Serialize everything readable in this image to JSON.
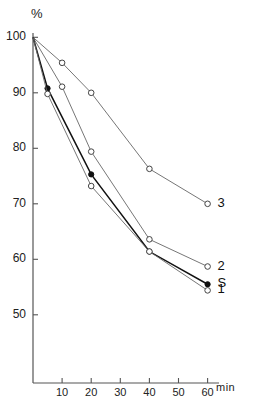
{
  "chart_data": {
    "type": "line",
    "title": "",
    "subtitle": "",
    "xlabel": "min",
    "ylabel": "%",
    "xlim": [
      0,
      62
    ],
    "ylim": [
      46,
      101
    ],
    "grid": false,
    "legend_position": "right-of-curve-ends",
    "x_ticks": [
      10,
      20,
      30,
      40,
      50,
      60
    ],
    "y_ticks": [
      50,
      60,
      70,
      80,
      90,
      100
    ],
    "x_tick_labels": [
      "10",
      "20",
      "30",
      "40",
      "50",
      "60"
    ],
    "y_tick_labels": [
      "50",
      "60",
      "70",
      "80",
      "90",
      "100"
    ],
    "annotations": [
      {
        "text": "3",
        "x": 60,
        "y": 70.0
      },
      {
        "text": "2",
        "x": 60,
        "y": 58.7
      },
      {
        "text": "S",
        "x": 60,
        "y": 55.5
      },
      {
        "text": "1",
        "x": 60,
        "y": 54.4
      }
    ],
    "series": [
      {
        "name": "3",
        "marker": "open-circle",
        "x": [
          0,
          10,
          20,
          40,
          60
        ],
        "values": [
          100,
          95.4,
          90.0,
          76.3,
          70.0
        ]
      },
      {
        "name": "2",
        "marker": "open-circle",
        "x": [
          0,
          10,
          20,
          40,
          60
        ],
        "values": [
          100,
          91.1,
          79.4,
          63.6,
          58.7
        ]
      },
      {
        "name": "S",
        "marker": "filled-circle",
        "x": [
          0,
          5,
          20,
          40,
          60
        ],
        "values": [
          100,
          90.8,
          75.3,
          61.4,
          55.5
        ]
      },
      {
        "name": "1",
        "marker": "open-circle",
        "x": [
          0,
          5,
          20,
          40,
          60
        ],
        "values": [
          100,
          89.8,
          73.2,
          61.4,
          54.4
        ]
      }
    ]
  },
  "axes": {
    "y_unit": "%",
    "x_unit": "min"
  }
}
